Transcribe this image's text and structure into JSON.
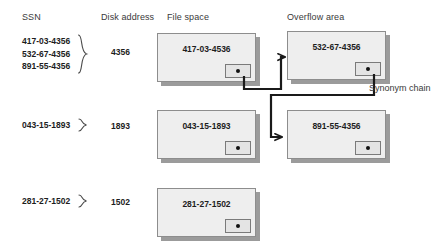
{
  "headers": {
    "ssn": "SSN",
    "disk_address": "Disk address",
    "file_space": "File space",
    "overflow_area": "Overflow area"
  },
  "annotations": {
    "synonym_chain": "Synonym chain"
  },
  "groups": [
    {
      "ssns": [
        "417-03-4356",
        "532-67-4356",
        "891-55-4356"
      ],
      "disk_address": "4356"
    },
    {
      "ssns": [
        "043-15-1893"
      ],
      "disk_address": "1893"
    },
    {
      "ssns": [
        "281-27-1502"
      ],
      "disk_address": "1502"
    }
  ],
  "records": {
    "file_space": [
      {
        "key": "417-03-4536",
        "pointer": "filled"
      },
      {
        "key": "043-15-1893",
        "pointer": "filled"
      },
      {
        "key": "281-27-1502",
        "pointer": "filled"
      }
    ],
    "overflow_area": [
      {
        "key": "532-67-4356",
        "pointer": "filled"
      },
      {
        "key": "891-55-4356",
        "pointer": "filled"
      }
    ]
  },
  "colors": {
    "box_fill": "#eeeeee",
    "box_border": "#8d8d8d",
    "box_shadow": "#9b9b9b",
    "pointer_fill": "#e4e4e4",
    "pointer_dot": "#111111",
    "connector": "#1a1a1a",
    "header_text": "#3a3a3a",
    "body_text": "#1d1d1d",
    "background": "#ffffff"
  }
}
